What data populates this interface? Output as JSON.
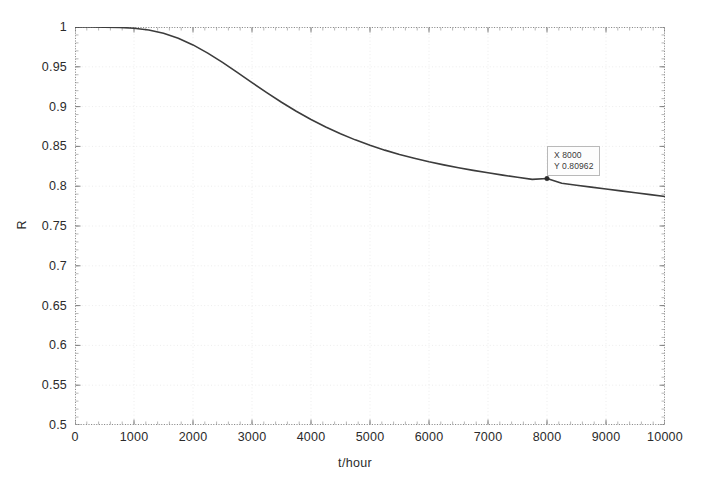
{
  "figure": {
    "background_color": "#ffffff",
    "axes_color": "#808080",
    "grid_color": "#e8e8e8",
    "line_color": "#3c3c3c"
  },
  "axis": {
    "xlabel": "t/hour",
    "ylabel": "R",
    "xticks": [
      "0",
      "1000",
      "2000",
      "3000",
      "4000",
      "5000",
      "6000",
      "7000",
      "8000",
      "9000",
      "10000"
    ],
    "yticks": [
      "0.5",
      "0.55",
      "0.6",
      "0.65",
      "0.7",
      "0.75",
      "0.8",
      "0.85",
      "0.9",
      "0.95",
      "1"
    ]
  },
  "datatip": {
    "x_label": "X 8000",
    "y_label": "Y 0.80962",
    "x_value": 8000,
    "y_value": 0.80962
  },
  "chart_data": {
    "type": "line",
    "title": "",
    "xlabel": "t/hour",
    "ylabel": "R",
    "xlim": [
      0,
      10000
    ],
    "ylim": [
      0.5,
      1.0
    ],
    "xticks": [
      0,
      1000,
      2000,
      3000,
      4000,
      5000,
      6000,
      7000,
      8000,
      9000,
      10000
    ],
    "yticks": [
      0.5,
      0.55,
      0.6,
      0.65,
      0.7,
      0.75,
      0.8,
      0.85,
      0.9,
      0.95,
      1.0
    ],
    "grid": true,
    "legend": null,
    "series": [
      {
        "name": "R(t)",
        "color": "#3c3c3c",
        "x": [
          0,
          250,
          500,
          750,
          1000,
          1250,
          1500,
          1750,
          2000,
          2250,
          2500,
          2750,
          3000,
          3250,
          3500,
          3750,
          4000,
          4250,
          4500,
          4750,
          5000,
          5250,
          5500,
          5750,
          6000,
          6250,
          6500,
          6750,
          7000,
          7250,
          7500,
          7750,
          8000,
          8250,
          8500,
          8750,
          9000,
          9250,
          9500,
          9750,
          10000
        ],
        "y": [
          1.0,
          1.0,
          0.9999,
          0.9995,
          0.9985,
          0.9962,
          0.9921,
          0.9859,
          0.9775,
          0.9672,
          0.9556,
          0.9431,
          0.9302,
          0.9176,
          0.9055,
          0.8942,
          0.8838,
          0.8743,
          0.8658,
          0.8582,
          0.8514,
          0.8453,
          0.8399,
          0.8351,
          0.8307,
          0.8268,
          0.8232,
          0.8199,
          0.8168,
          0.8139,
          0.8112,
          0.8086,
          0.80962,
          0.8036,
          0.8012,
          0.7988,
          0.7965,
          0.7941,
          0.7918,
          0.7894,
          0.787
        ]
      }
    ],
    "annotations": [
      {
        "name": "datatip",
        "x": 8000,
        "y": 0.80962,
        "text": "X 8000 / Y 0.80962"
      }
    ]
  }
}
